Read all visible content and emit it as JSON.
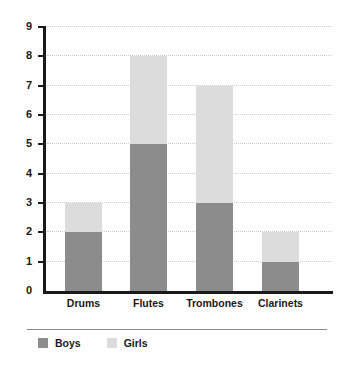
{
  "chart_data": {
    "type": "bar",
    "stacked": true,
    "title": "",
    "subtitle": "",
    "xlabel": "",
    "ylabel": "",
    "categories": [
      "Drums",
      "Flutes",
      "Trombones",
      "Clarinets"
    ],
    "series": [
      {
        "name": "Boys",
        "color": "#8c8c8c",
        "values": [
          2,
          5,
          3,
          1
        ]
      },
      {
        "name": "Girls",
        "color": "#dcdcdc",
        "values": [
          1,
          3,
          4,
          1
        ]
      }
    ],
    "totals": [
      3,
      8,
      7,
      2
    ],
    "ylim": [
      0,
      9
    ],
    "y_ticks": [
      0,
      1,
      2,
      3,
      4,
      5,
      6,
      7,
      8,
      9
    ],
    "y_tick_labels": [
      "0",
      "1",
      "2",
      "3",
      "4",
      "5",
      "6",
      "7",
      "8",
      "9"
    ],
    "grid": true,
    "grid_style": "dotted-horizontal",
    "legend_position": "bottom-left",
    "legend": [
      {
        "label": "Boys",
        "color": "#8c8c8c"
      },
      {
        "label": "Girls",
        "color": "#dcdcdc"
      }
    ],
    "axis_color": "#1a1a1a",
    "grid_color": "#c9c9d6",
    "background": "#ffffff"
  }
}
